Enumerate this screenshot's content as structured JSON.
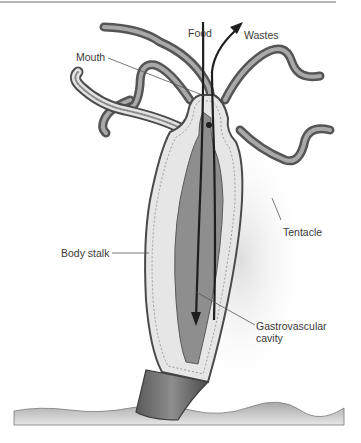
{
  "figure": {
    "labels": {
      "food": "Food",
      "wastes": "Wastes",
      "mouth": "Mouth",
      "tentacle": "Tentacle",
      "body_stalk": "Body stalk",
      "gastrovascular_line1": "Gastrovascular",
      "gastrovascular_line2": "cavity"
    },
    "colors": {
      "tentacle": "#7a7a7a",
      "tentacle_highlight": "#c8c8c8",
      "body_wall": "#e4e4e4",
      "cavity": "#8c8c8c",
      "arrow": "#1e1e1e",
      "ground": "#c9c9c9",
      "label_text": "#3a3a3a",
      "leader_line": "#555555"
    }
  }
}
